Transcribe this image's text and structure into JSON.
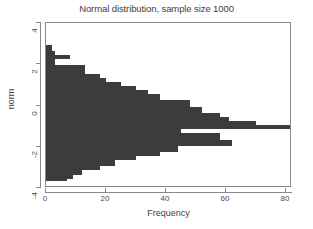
{
  "chart_data": {
    "type": "bar",
    "orientation": "horizontal",
    "title": "Normal distribution, sample size 1000",
    "xlabel": "Frequency",
    "ylabel": "norm",
    "xlim": [
      0,
      82
    ],
    "ylim": [
      -4,
      4
    ],
    "xticks": [
      0,
      20,
      40,
      60,
      80
    ],
    "yticks": [
      4,
      2,
      0,
      -2,
      -4
    ],
    "grid": false,
    "legend": false,
    "bar_color": "#3c3c3c",
    "bin_width": 0.1,
    "categories": [
      2.9,
      2.8,
      2.7,
      2.6,
      2.5,
      2.4,
      2.3,
      2.2,
      2.1,
      2.0,
      1.9,
      1.8,
      1.7,
      1.6,
      1.5,
      1.4,
      1.3,
      1.2,
      1.1,
      1.0,
      0.9,
      0.8,
      0.7,
      0.6,
      0.5,
      0.4,
      0.3,
      0.2,
      0.1,
      0.0,
      -0.1,
      -0.2,
      -0.3,
      -0.4,
      -0.5,
      -0.6,
      -0.7,
      -0.8,
      -0.9,
      -1.0,
      -1.1,
      -1.2,
      -1.3,
      -1.4,
      -1.5,
      -1.6,
      -1.7,
      -1.8,
      -1.9,
      -2.0,
      -2.1,
      -2.2,
      -2.3,
      -2.4,
      -2.5,
      -2.6,
      -2.7,
      -2.8,
      -2.9,
      -3.0,
      -3.1,
      -3.2,
      -3.3,
      -3.4,
      -3.5,
      -3.6
    ],
    "values": [
      2,
      2,
      2,
      3,
      3,
      8,
      8,
      3,
      3,
      3,
      13,
      13,
      13,
      13,
      18,
      18,
      20,
      20,
      25,
      25,
      30,
      30,
      34,
      34,
      38,
      38,
      38,
      48,
      48,
      48,
      52,
      52,
      52,
      58,
      58,
      61,
      61,
      70,
      70,
      82,
      82,
      45,
      45,
      58,
      58,
      58,
      62,
      62,
      62,
      44,
      44,
      44,
      38,
      38,
      30,
      30,
      23,
      23,
      23,
      18,
      18,
      12,
      12,
      9,
      9,
      7
    ],
    "ylabel_text_values": [
      "4",
      "2",
      "0",
      "-2",
      "-4"
    ],
    "xlabel_text_values": [
      "0",
      "20",
      "40",
      "60",
      "80"
    ]
  },
  "axis": {
    "x_title": "Frequency",
    "y_title": "norm"
  },
  "title": "Normal distribution, sample size 1000"
}
